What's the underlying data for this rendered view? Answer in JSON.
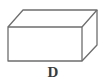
{
  "diagram": {
    "shape": "rectangular-prism",
    "label": "D",
    "stroke_color": "#6e6e6e",
    "front_face": {
      "x1": 8,
      "y1": 27,
      "x2": 82,
      "y2": 61
    },
    "back_offset": {
      "dx": 15,
      "dy": -17
    }
  }
}
